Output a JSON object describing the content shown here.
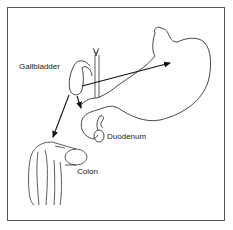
{
  "diagram": {
    "type": "anatomical-illustration",
    "labels": {
      "gallbladder": "Gallbladder",
      "duodenum": "Duodenum",
      "colon": "Colon"
    },
    "organs": [
      "gallbladder",
      "bile-duct",
      "stomach",
      "duodenum",
      "colon"
    ],
    "arrows": [
      {
        "from": "gallbladder",
        "to": "stomach"
      },
      {
        "from": "gallbladder",
        "to": "duodenum"
      },
      {
        "from": "gallbladder",
        "to": "colon"
      }
    ],
    "colors": {
      "stroke": "#333333",
      "arrow": "#111111",
      "frame": "#555555",
      "background": "#ffffff"
    }
  }
}
